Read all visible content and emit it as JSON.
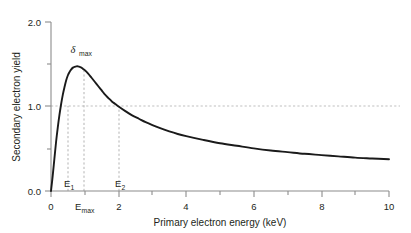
{
  "figure": {
    "background_color": "#ffffff",
    "curve_color": "#1a1a1a",
    "axis_color": "#808080",
    "grid_color": "#bfbfbf",
    "guide_color": "#b3b3b3"
  },
  "chart_data": {
    "type": "line",
    "title": "",
    "subtitle": "",
    "xlabel": "Primary electron energy (keV)",
    "ylabel": "Secondary electron yield",
    "xlim": [
      0,
      10
    ],
    "ylim": [
      0.0,
      2.0
    ],
    "grid": true,
    "legend": "none",
    "xticks": [
      0,
      2,
      4,
      6,
      8,
      10
    ],
    "xtick_labels": [
      "0",
      "2",
      "4",
      "6",
      "8",
      "10"
    ],
    "xminor_ticks": [
      1,
      3,
      5,
      7,
      9
    ],
    "yticks": [
      0.0,
      1.0,
      2.0
    ],
    "ytick_labels": [
      "0.0",
      "1.0",
      "2.0"
    ],
    "yminor_ticks": [
      0.5,
      1.5
    ],
    "gridlines": {
      "horizontal": [
        1.0
      ]
    },
    "series": [
      {
        "name": "Secondary electron yield",
        "x": [
          0.0,
          0.05,
          0.1,
          0.15,
          0.2,
          0.25,
          0.3,
          0.35,
          0.4,
          0.45,
          0.5,
          0.55,
          0.6,
          0.65,
          0.7,
          0.75,
          0.8,
          0.85,
          0.9,
          0.95,
          1.0,
          1.1,
          1.2,
          1.3,
          1.4,
          1.5,
          1.6,
          1.7,
          1.8,
          1.9,
          2.0,
          2.2,
          2.4,
          2.6,
          2.8,
          3.0,
          3.25,
          3.5,
          3.75,
          4.0,
          4.5,
          5.0,
          5.5,
          6.0,
          6.5,
          7.0,
          7.5,
          8.0,
          8.5,
          9.0,
          9.5,
          10.0
        ],
        "y": [
          0.0,
          0.18,
          0.38,
          0.58,
          0.75,
          0.9,
          1.03,
          1.14,
          1.23,
          1.31,
          1.37,
          1.41,
          1.44,
          1.46,
          1.47,
          1.475,
          1.475,
          1.47,
          1.46,
          1.445,
          1.43,
          1.39,
          1.34,
          1.29,
          1.24,
          1.19,
          1.14,
          1.1,
          1.06,
          1.03,
          1.0,
          0.945,
          0.895,
          0.855,
          0.815,
          0.78,
          0.74,
          0.705,
          0.675,
          0.65,
          0.605,
          0.565,
          0.535,
          0.505,
          0.48,
          0.46,
          0.44,
          0.425,
          0.41,
          0.395,
          0.385,
          0.375
        ]
      }
    ],
    "annotations": [
      {
        "id": "delta-max",
        "label": "δ",
        "subscript": "max",
        "kind": "peak-label",
        "x": 0.97,
        "y": 1.475,
        "description": "Maximum secondary electron yield at the curve peak"
      },
      {
        "id": "e1",
        "label": "E",
        "subscript": "1",
        "kind": "crossover",
        "x": 0.5,
        "y": 1.0,
        "description": "First crossover energy where yield equals 1.0"
      },
      {
        "id": "emax",
        "label": "E",
        "subscript": "max",
        "kind": "axis-tick-label",
        "x": 0.97,
        "y": 1.475,
        "description": "Primary energy at which yield is maximum"
      },
      {
        "id": "e2",
        "label": "E",
        "subscript": "2",
        "kind": "crossover",
        "x": 2.0,
        "y": 1.0,
        "description": "Second crossover energy where yield equals 1.0"
      }
    ],
    "guide_lines": [
      {
        "id": "guide-e1",
        "orientation": "vertical",
        "x": 0.5,
        "from_y": 0.0,
        "to_y": 1.0
      },
      {
        "id": "guide-emax",
        "orientation": "vertical",
        "x": 0.97,
        "from_y": 0.0,
        "to_y": 1.475
      },
      {
        "id": "guide-e2",
        "orientation": "vertical",
        "x": 2.0,
        "from_y": 0.0,
        "to_y": 1.0
      },
      {
        "id": "guide-unity",
        "orientation": "horizontal",
        "y": 1.0,
        "from_x": 0.0,
        "to_x": 10.0
      }
    ]
  }
}
